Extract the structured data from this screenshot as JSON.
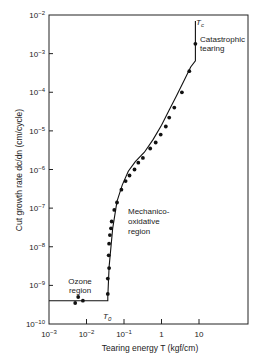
{
  "chart_data": {
    "type": "line",
    "title": "",
    "xlabel": "Tearing energy T (kgf/cm)",
    "ylabel": "Cut growth rate dc/dn (cm/cycle)",
    "xscale": "log",
    "yscale": "log",
    "xlim": [
      0.001,
      100
    ],
    "ylim": [
      1e-10,
      0.01
    ],
    "x_ticks": [
      {
        "value": 0.001,
        "label": "10^-3"
      },
      {
        "value": 0.01,
        "label": "10^-2"
      },
      {
        "value": 0.1,
        "label": "10^-1"
      },
      {
        "value": 1,
        "label": "1"
      },
      {
        "value": 10,
        "label": "10"
      }
    ],
    "y_ticks": [
      {
        "value": 1e-10,
        "label": "10^-10"
      },
      {
        "value": 1e-09,
        "label": "10^-9"
      },
      {
        "value": 1e-08,
        "label": "10^-8"
      },
      {
        "value": 1e-07,
        "label": "10^-7"
      },
      {
        "value": 1e-06,
        "label": "10^-6"
      },
      {
        "value": 1e-05,
        "label": "10^-5"
      },
      {
        "value": 0.0001,
        "label": "10^-4"
      },
      {
        "value": 0.001,
        "label": "10^-3"
      },
      {
        "value": 0.01,
        "label": "10^-2"
      }
    ],
    "grid": false,
    "legend": null,
    "series": [
      {
        "name": "Fitted curve",
        "style": "line",
        "x": [
          0.001,
          0.037,
          0.037,
          0.04,
          0.05,
          0.065,
          0.09,
          0.13,
          0.2,
          0.35,
          0.6,
          1.0,
          1.6,
          2.5,
          4.0,
          6.0,
          8.0,
          8.0
        ],
        "y": [
          4e-10,
          4e-10,
          5e-10,
          3e-09,
          3e-08,
          1.5e-07,
          4e-07,
          9e-07,
          1.6e-06,
          2.8e-06,
          6e-06,
          1.4e-05,
          3.5e-05,
          8e-05,
          0.0002,
          0.00045,
          0.00065,
          0.007
        ]
      },
      {
        "name": "Experimental points",
        "style": "scatter",
        "x": [
          0.005,
          0.006,
          0.008,
          0.037,
          0.037,
          0.04,
          0.039,
          0.04,
          0.042,
          0.045,
          0.047,
          0.055,
          0.065,
          0.085,
          0.11,
          0.14,
          0.19,
          0.24,
          0.32,
          0.5,
          0.7,
          0.95,
          1.3,
          1.6,
          2.2,
          3.5,
          5.5,
          8.0
        ],
        "y": [
          3.5e-10,
          5e-10,
          4e-10,
          6e-10,
          1.5e-09,
          2.8e-09,
          6e-09,
          1.2e-08,
          2e-08,
          3e-08,
          4.5e-08,
          9e-08,
          1.4e-07,
          3e-07,
          5e-07,
          7e-07,
          1e-06,
          1.5e-06,
          2e-06,
          3.5e-06,
          5e-06,
          8e-06,
          1.3e-05,
          2.2e-05,
          4e-05,
          0.0001,
          0.00035,
          0.0018
        ]
      }
    ],
    "annotations": [
      {
        "text": "Tc",
        "x": 8.0,
        "y": 0.0075
      },
      {
        "text": "Catastrophic tearing",
        "x": 12,
        "y": 0.0015
      },
      {
        "text": "T0",
        "x": 0.04,
        "y": 1.6e-10
      },
      {
        "text": "Ozone region",
        "x": 0.006,
        "y": 1e-09
      },
      {
        "text": "Mechanico-oxidative region",
        "x": 0.1,
        "y": 2e-08
      }
    ]
  },
  "labels": {
    "xlabel": "Tearing energy T (kgf/cm)",
    "ylabel": "Cut growth rate dc/dn (cm/cycle)",
    "tc": "T",
    "tc_sub": "c",
    "t0": "T",
    "t0_sub": "0",
    "catastrophic_1": "Catastrophic",
    "catastrophic_2": "tearing",
    "ozone_1": "Ozone",
    "ozone_2": "region",
    "mech_1": "Mechanico-",
    "mech_2": "oxidative",
    "mech_3": "region"
  }
}
